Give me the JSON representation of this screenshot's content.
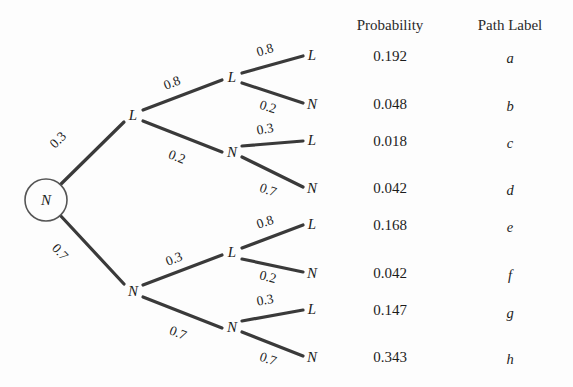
{
  "diagram": {
    "type": "probability-tree",
    "background_color": "#fdfdfd",
    "line_color": "#3a3a3a",
    "text_color": "#1c1c1c",
    "root": {
      "label": "N",
      "shape": "circle"
    },
    "nodes": {
      "level1": [
        {
          "id": "L1",
          "label": "L"
        },
        {
          "id": "N1",
          "label": "N"
        }
      ],
      "level2": [
        {
          "id": "L1L",
          "label": "L"
        },
        {
          "id": "L1N",
          "label": "N"
        },
        {
          "id": "N1L",
          "label": "L"
        },
        {
          "id": "N1N",
          "label": "N"
        }
      ],
      "leaves": [
        {
          "id": "leaf-a",
          "label": "L"
        },
        {
          "id": "leaf-b",
          "label": "N"
        },
        {
          "id": "leaf-c",
          "label": "L"
        },
        {
          "id": "leaf-d",
          "label": "N"
        },
        {
          "id": "leaf-e",
          "label": "L"
        },
        {
          "id": "leaf-f",
          "label": "N"
        },
        {
          "id": "leaf-g",
          "label": "L"
        },
        {
          "id": "leaf-h",
          "label": "N"
        }
      ]
    },
    "edge_labels": {
      "root_to_L1": "0.3",
      "root_to_N1": "0.7",
      "L1_to_L": "0.8",
      "L1_to_N": "0.2",
      "N1_to_L": "0.3",
      "N1_to_N": "0.7",
      "L1L_to_L": "0.8",
      "L1L_to_N": "0.2",
      "L1N_to_L": "0.3",
      "L1N_to_N": "0.7",
      "N1L_to_L": "0.8",
      "N1L_to_N": "0.2",
      "N1N_to_L": "0.3",
      "N1N_to_N": "0.7"
    }
  },
  "table": {
    "headers": {
      "probability": "Probability",
      "path_label": "Path Label"
    },
    "rows": [
      {
        "probability": "0.192",
        "path_label": "a"
      },
      {
        "probability": "0.048",
        "path_label": "b"
      },
      {
        "probability": "0.018",
        "path_label": "c"
      },
      {
        "probability": "0.042",
        "path_label": "d"
      },
      {
        "probability": "0.168",
        "path_label": "e"
      },
      {
        "probability": "0.042",
        "path_label": "f"
      },
      {
        "probability": "0.147",
        "path_label": "g"
      },
      {
        "probability": "0.343",
        "path_label": "h"
      }
    ]
  }
}
